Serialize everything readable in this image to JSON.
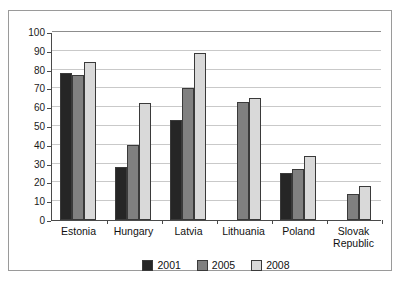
{
  "chart_data": {
    "type": "bar",
    "title": "",
    "subtitle": "",
    "xlabel": "",
    "ylabel": "",
    "ylim": [
      0,
      100
    ],
    "ytick_step": 10,
    "yticks": [
      "0",
      "10",
      "20",
      "30",
      "40",
      "50",
      "60",
      "70",
      "80",
      "90",
      "100"
    ],
    "grid": true,
    "legend_position": "bottom-center",
    "categories": [
      "Estonia",
      "Hungary",
      "Latvia",
      "Lithuania",
      "Poland",
      "Slovak\nRepublic"
    ],
    "series": [
      {
        "name": "2001",
        "color": "#262626",
        "values": [
          78,
          28,
          53,
          null,
          25,
          null
        ]
      },
      {
        "name": "2005",
        "color": "#808080",
        "values": [
          77,
          40,
          70,
          63,
          27,
          14
        ]
      },
      {
        "name": "2008",
        "color": "#d9d9d9",
        "values": [
          84,
          62,
          89,
          65,
          34,
          18
        ]
      }
    ]
  },
  "legend": {
    "entries": [
      {
        "label": "2001",
        "color": "#262626"
      },
      {
        "label": "2005",
        "color": "#808080"
      },
      {
        "label": "2008",
        "color": "#d9d9d9"
      }
    ]
  },
  "axis": {
    "y_max_label": "100",
    "y_min_label": "0"
  }
}
